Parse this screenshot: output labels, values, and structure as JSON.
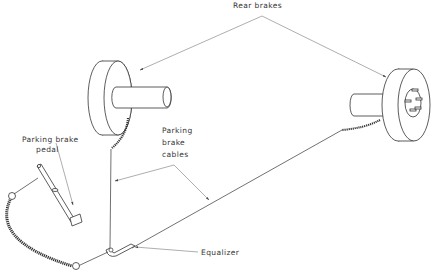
{
  "diagram": {
    "labels": {
      "rear_brakes": "Rear brakes",
      "parking_brake_pedal_line1": "Parking brake",
      "parking_brake_pedal_line2": "pedal",
      "parking_brake_cables_line1": "Parking",
      "parking_brake_cables_line2": "brake",
      "parking_brake_cables_line3": "cables",
      "equalizer": "Equalizer"
    },
    "components": [
      "left-rear-brake",
      "right-rear-brake",
      "parking-brake-pedal",
      "parking-brake-cables",
      "equalizer",
      "front-cable"
    ],
    "colors": {
      "line": "#333333",
      "leader": "#777777",
      "background": "#ffffff"
    }
  }
}
